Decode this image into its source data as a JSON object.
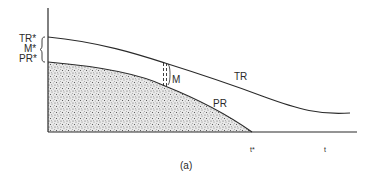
{
  "diagram": {
    "caption": "(a)",
    "y_axis_labels": {
      "tr_star": "TR*",
      "m_star": "M*",
      "pr_star": "PR*"
    },
    "curve_labels": {
      "tr": "TR",
      "pr": "PR",
      "margin": "M"
    },
    "x_axis_labels": {
      "t_star": "t*",
      "t": "t"
    },
    "colors": {
      "line": "#2a2a2a",
      "stipple_fill": "#8a8a8a",
      "background": "#ffffff"
    }
  }
}
